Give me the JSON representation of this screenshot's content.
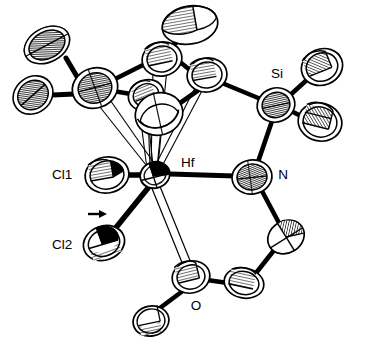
{
  "figure": {
    "kind": "ortep-thermal-ellipsoid-plot",
    "title": "",
    "background_color": "#ffffff",
    "line_color": "#000000",
    "hatch_color": "#000000",
    "width": 369,
    "height": 352,
    "faint_top_caption": "",
    "labels": [
      {
        "id": "Si",
        "text": "Si",
        "x": 277,
        "y": 74
      },
      {
        "id": "Hf",
        "text": "Hf",
        "x": 181,
        "y": 163
      },
      {
        "id": "N",
        "text": "N",
        "x": 283,
        "y": 175
      },
      {
        "id": "Cl1",
        "text": "Cl1",
        "x": 52,
        "y": 175
      },
      {
        "id": "Cl2",
        "text": "Cl2",
        "x": 52,
        "y": 245
      },
      {
        "id": "O",
        "text": "O",
        "x": 196,
        "y": 306
      }
    ],
    "annotations": [
      {
        "id": "arrow-cl2",
        "type": "arrow",
        "direction": "right",
        "x": 96,
        "y": 214
      }
    ],
    "atoms": [
      {
        "id": "Hf",
        "element": "Hf",
        "cx": 155,
        "cy": 175,
        "rx": 15,
        "ry": 13,
        "rot": -20,
        "style": "metal",
        "label": "Hf"
      },
      {
        "id": "Cl1",
        "element": "Cl",
        "cx": 107,
        "cy": 175,
        "rx": 21,
        "ry": 17,
        "rot": -12,
        "style": "half",
        "label": "Cl1"
      },
      {
        "id": "Cl2",
        "element": "Cl",
        "cx": 104,
        "cy": 243,
        "rx": 20,
        "ry": 16,
        "rot": -22,
        "style": "half",
        "label": "Cl2"
      },
      {
        "id": "O",
        "element": "O",
        "cx": 191,
        "cy": 277,
        "rx": 18,
        "ry": 15,
        "rot": -15,
        "style": "half",
        "label": "O"
      },
      {
        "id": "N",
        "element": "N",
        "cx": 252,
        "cy": 177,
        "rx": 19,
        "ry": 16,
        "rot": -10,
        "style": "half",
        "label": "N"
      },
      {
        "id": "Si",
        "element": "Si",
        "cx": 276,
        "cy": 105,
        "rx": 18,
        "ry": 16,
        "rot": -18,
        "style": "half",
        "label": "Si"
      },
      {
        "id": "C1",
        "element": "C",
        "cx": 322,
        "cy": 67,
        "rx": 20,
        "ry": 17,
        "rot": -25,
        "style": "half",
        "label": ""
      },
      {
        "id": "C2",
        "element": "C",
        "cx": 319,
        "cy": 121,
        "rx": 21,
        "ry": 18,
        "rot": 15,
        "style": "half",
        "label": ""
      },
      {
        "id": "C3",
        "element": "C",
        "cx": 286,
        "cy": 237,
        "rx": 18,
        "ry": 15,
        "rot": -30,
        "style": "half",
        "label": ""
      },
      {
        "id": "C4",
        "element": "C",
        "cx": 244,
        "cy": 283,
        "rx": 19,
        "ry": 14,
        "rot": 15,
        "style": "half",
        "label": ""
      },
      {
        "id": "C5",
        "element": "C",
        "cx": 152,
        "cy": 320,
        "rx": 17,
        "ry": 14,
        "rot": -15,
        "style": "half",
        "label": ""
      },
      {
        "id": "Cp1",
        "element": "C",
        "cx": 95,
        "cy": 88,
        "rx": 22,
        "ry": 19,
        "rot": -20,
        "style": "half",
        "label": ""
      },
      {
        "id": "Cp2",
        "element": "C",
        "cx": 162,
        "cy": 59,
        "rx": 19,
        "ry": 16,
        "rot": -15,
        "style": "half",
        "label": ""
      },
      {
        "id": "Cp3",
        "element": "C",
        "cx": 207,
        "cy": 75,
        "rx": 19,
        "ry": 16,
        "rot": -10,
        "style": "half",
        "label": ""
      },
      {
        "id": "Cp4",
        "element": "C",
        "cx": 157,
        "cy": 113,
        "rx": 22,
        "ry": 19,
        "rot": -20,
        "style": "half",
        "label": ""
      },
      {
        "id": "Cp5",
        "element": "C",
        "cx": 146,
        "cy": 95,
        "rx": 17,
        "ry": 14,
        "rot": -25,
        "style": "half",
        "label": ""
      },
      {
        "id": "Me1",
        "element": "C",
        "cx": 47,
        "cy": 45,
        "rx": 24,
        "ry": 18,
        "rot": -30,
        "style": "half",
        "label": ""
      },
      {
        "id": "Me2",
        "element": "C",
        "cx": 33,
        "cy": 95,
        "rx": 21,
        "ry": 18,
        "rot": -35,
        "style": "half",
        "label": ""
      },
      {
        "id": "Me3",
        "element": "C",
        "cx": 190,
        "cy": 25,
        "rx": 27,
        "ry": 20,
        "rot": -12,
        "style": "half",
        "label": ""
      }
    ],
    "bonds": [
      {
        "from": "Hf",
        "to": "Cl1",
        "style": "solid"
      },
      {
        "from": "Hf",
        "to": "Cl2",
        "style": "solid"
      },
      {
        "from": "Hf",
        "to": "N",
        "style": "solid"
      },
      {
        "from": "Hf",
        "to": "O",
        "style": "open"
      },
      {
        "from": "N",
        "to": "Si",
        "style": "solid"
      },
      {
        "from": "Si",
        "to": "C1",
        "style": "solid"
      },
      {
        "from": "Si",
        "to": "C2",
        "style": "solid"
      },
      {
        "from": "Si",
        "to": "Cp3",
        "style": "solid"
      },
      {
        "from": "N",
        "to": "C3",
        "style": "solid"
      },
      {
        "from": "C3",
        "to": "C4",
        "style": "solid"
      },
      {
        "from": "C4",
        "to": "O",
        "style": "solid"
      },
      {
        "from": "O",
        "to": "C5",
        "style": "solid"
      },
      {
        "from": "Cp1",
        "to": "Cp2",
        "style": "solid"
      },
      {
        "from": "Cp2",
        "to": "Cp3",
        "style": "solid"
      },
      {
        "from": "Cp3",
        "to": "Cp4",
        "style": "solid"
      },
      {
        "from": "Cp4",
        "to": "Cp5",
        "style": "solid"
      },
      {
        "from": "Cp5",
        "to": "Cp1",
        "style": "solid"
      },
      {
        "from": "Cp1",
        "to": "Me1",
        "style": "solid"
      },
      {
        "from": "Cp1",
        "to": "Me2",
        "style": "solid"
      },
      {
        "from": "Cp2",
        "to": "Me3",
        "style": "solid"
      },
      {
        "from": "Hf",
        "to": "Cp1",
        "style": "open"
      },
      {
        "from": "Hf",
        "to": "Cp2",
        "style": "open"
      },
      {
        "from": "Hf",
        "to": "Cp3",
        "style": "open"
      },
      {
        "from": "Hf",
        "to": "Cp4",
        "style": "open"
      },
      {
        "from": "Hf",
        "to": "Cp5",
        "style": "open"
      }
    ]
  }
}
